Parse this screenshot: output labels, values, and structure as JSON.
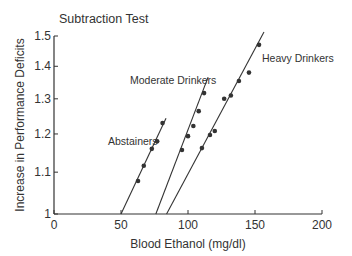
{
  "chart_data": {
    "type": "scatter",
    "title": "Subtraction Test",
    "xlabel": "Blood Ethanol (mg/dl)",
    "ylabel": "Increase in Performance Deficits",
    "xlim": [
      0,
      200
    ],
    "ylim": [
      1,
      1.5
    ],
    "yscale": "log",
    "grid": false,
    "legend": "inline labels",
    "x_ticks": [
      0,
      50,
      100,
      150,
      200
    ],
    "x_tick_labels": [
      "0",
      "50",
      "100",
      "150",
      "200"
    ],
    "y_ticks": [
      1,
      1.1,
      1.2,
      1.3,
      1.4,
      1.5
    ],
    "y_tick_labels": [
      "1",
      "1.1",
      "1.2",
      "1.3",
      "1.4",
      "1.5"
    ],
    "series": [
      {
        "name": "Abstainers",
        "points": [
          [
            62.7,
            1.078
          ],
          [
            67,
            1.116
          ],
          [
            73,
            1.16
          ],
          [
            77,
            1.18
          ],
          [
            81,
            1.23
          ]
        ],
        "fit_line": [
          [
            50,
            1.0
          ],
          [
            83.6,
            1.244
          ]
        ],
        "label_pos": [
          108,
          145
        ]
      },
      {
        "name": "Moderate Drinkers",
        "points": [
          [
            95.5,
            1.157
          ],
          [
            100,
            1.194
          ],
          [
            104,
            1.222
          ],
          [
            108,
            1.264
          ],
          [
            112,
            1.317
          ]
        ],
        "fit_line": [
          [
            76,
            1.0
          ],
          [
            115,
            1.366
          ]
        ],
        "label_pos": [
          130,
          84
        ]
      },
      {
        "name": "Heavy Drinkers",
        "points": [
          [
            110.4,
            1.162
          ],
          [
            116.4,
            1.197
          ],
          [
            120,
            1.208
          ],
          [
            127,
            1.3
          ],
          [
            132,
            1.31
          ],
          [
            138,
            1.354
          ],
          [
            145.5,
            1.38
          ],
          [
            153,
            1.47
          ]
        ],
        "fit_line": [
          [
            84,
            1.0
          ],
          [
            156.7,
            1.514
          ]
        ],
        "label_pos": [
          262,
          62
        ]
      }
    ],
    "colors": {
      "ink": "#333333",
      "background": "#ffffff"
    }
  }
}
